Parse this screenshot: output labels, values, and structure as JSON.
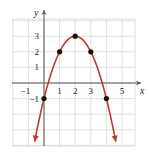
{
  "chart_data": {
    "type": "line",
    "title": "",
    "xlabel": "x",
    "ylabel": "y",
    "function": "y = -(x - 2)^2 + 3",
    "xlim": [
      -2,
      6
    ],
    "ylim": [
      -4,
      4
    ],
    "grid": true,
    "x_ticks": [
      -1,
      1,
      2,
      3,
      5
    ],
    "y_ticks": [
      -1,
      1,
      2,
      3
    ],
    "x_tick_labels": [
      "−1",
      "1",
      "2",
      "3",
      "5"
    ],
    "y_tick_labels": [
      "−1",
      "1",
      "2",
      "3"
    ],
    "points": [
      {
        "x": 0,
        "y": -1
      },
      {
        "x": 1,
        "y": 2
      },
      {
        "x": 2,
        "y": 3
      },
      {
        "x": 3,
        "y": 2
      },
      {
        "x": 4,
        "y": -1
      }
    ],
    "curve_color": "#c0392b",
    "point_color": "#111111",
    "grid_color": "#d8d8d8",
    "arrows_at_ends": true
  }
}
